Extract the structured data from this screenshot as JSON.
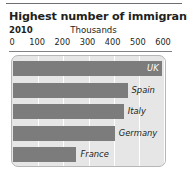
{
  "chart_data": {
    "type": "bar",
    "orientation": "horizontal",
    "title": "Highest number of immigrants",
    "subtitle": "2010",
    "units_label": "Thousands",
    "xlabel": "Thousands",
    "ylabel": "",
    "xlim": [
      0,
      600
    ],
    "xticks": [
      0,
      100,
      200,
      300,
      400,
      500,
      600
    ],
    "xtick_labels": [
      "0",
      "100",
      "200",
      "300",
      "400",
      "500",
      "600"
    ],
    "grid": true,
    "grid_axis": "x",
    "legend": false,
    "categories": [
      "UK",
      "Spain",
      "Italy",
      "Germany",
      "France"
    ],
    "values": [
      591,
      455,
      440,
      404,
      252
    ],
    "bars": [
      {
        "label": "UK",
        "value": 591,
        "label_position": "inside"
      },
      {
        "label": "Spain",
        "value": 455,
        "label_position": "outside"
      },
      {
        "label": "Italy",
        "value": 440,
        "label_position": "outside"
      },
      {
        "label": "Germany",
        "value": 404,
        "label_position": "outside"
      },
      {
        "label": "France",
        "value": 252,
        "label_position": "outside"
      }
    ],
    "colors": {
      "bar": "#7c7c7c",
      "plot_background": "#e6e6e6",
      "gridline": "#ffffff",
      "text": "#231f20",
      "axis_rule": "#808285",
      "top_rule": "#6d6e71",
      "inside_label": "#ffffff"
    }
  }
}
